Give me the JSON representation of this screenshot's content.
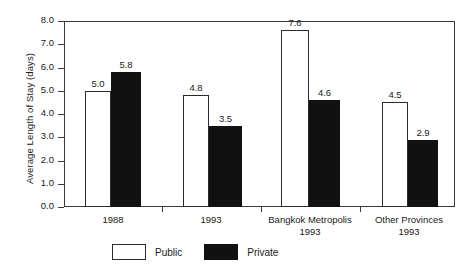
{
  "chart_data": {
    "type": "bar",
    "title": "",
    "xlabel": "",
    "ylabel": "Average Length of Stay (days)",
    "ylim": [
      0.0,
      8.0
    ],
    "ytick_labels": [
      "0.0",
      "1.0",
      "2.0",
      "3.0",
      "4.0",
      "5.0",
      "6.0",
      "7.0",
      "8.0"
    ],
    "ytick_values": [
      0.0,
      1.0,
      2.0,
      3.0,
      4.0,
      5.0,
      6.0,
      7.0,
      8.0
    ],
    "grid": false,
    "legend_position": "bottom-center",
    "categories": [
      "1988",
      "1993",
      "Bangkok Metropolis",
      "Other Provinces"
    ],
    "category_sublabels": [
      "",
      "",
      "1993",
      "1993"
    ],
    "series": [
      {
        "name": "Public",
        "color": "#ffffff",
        "edge_color": "#2b2b2b",
        "values": [
          5.0,
          4.8,
          7.6,
          4.5
        ],
        "value_labels": [
          "5.0",
          "4.8",
          "7.6",
          "4.5"
        ]
      },
      {
        "name": "Private",
        "color": "#111111",
        "edge_color": "#111111",
        "values": [
          5.8,
          3.5,
          4.6,
          2.9
        ],
        "value_labels": [
          "5.8",
          "3.5",
          "4.6",
          "2.9"
        ]
      }
    ]
  },
  "legend": {
    "entries": [
      {
        "label": "Public"
      },
      {
        "label": "Private"
      }
    ]
  }
}
